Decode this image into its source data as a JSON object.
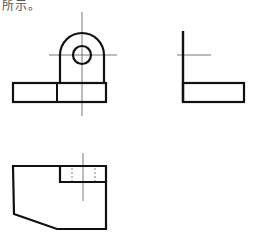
{
  "caption": "所示。",
  "colors": {
    "outline": "#111111",
    "centerline": "#555555",
    "hidden": "#777777"
  },
  "views": [
    {
      "name": "front-view"
    },
    {
      "name": "side-view"
    },
    {
      "name": "top-view"
    }
  ]
}
